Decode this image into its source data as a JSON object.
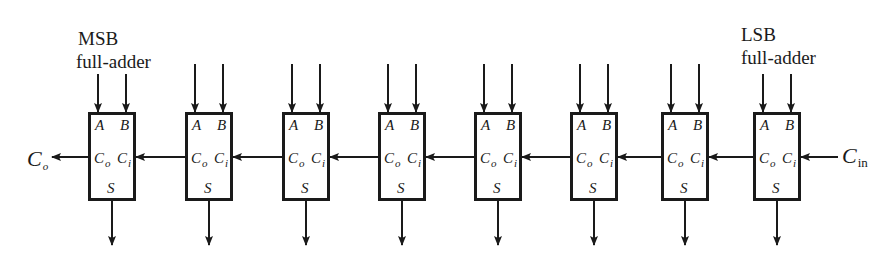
{
  "labels": {
    "msb_line1": "MSB",
    "msb_line2": "full-adder",
    "lsb_line1": "LSB",
    "lsb_line2": "full-adder",
    "carry_out_main": "C",
    "carry_out_sub": "o",
    "carry_in_main": "C",
    "carry_in_sub": "in"
  },
  "pins": {
    "a": "A",
    "b": "B",
    "co_main": "C",
    "co_sub": "o",
    "ci_main": "C",
    "ci_sub": "i",
    "s": "S"
  },
  "adders": [
    {
      "index": 0,
      "role": "MSB",
      "x": 88
    },
    {
      "index": 1,
      "role": "",
      "x": 185
    },
    {
      "index": 2,
      "role": "",
      "x": 282
    },
    {
      "index": 3,
      "role": "",
      "x": 378
    },
    {
      "index": 4,
      "role": "",
      "x": 474
    },
    {
      "index": 5,
      "role": "",
      "x": 570
    },
    {
      "index": 6,
      "role": "",
      "x": 661
    },
    {
      "index": 7,
      "role": "LSB",
      "x": 753
    }
  ],
  "colors": {
    "ink": "#1a1a1a",
    "background": "#ffffff"
  }
}
